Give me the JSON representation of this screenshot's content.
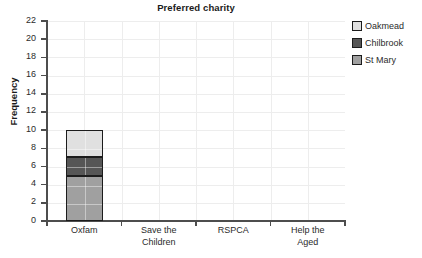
{
  "chart_data": {
    "type": "bar",
    "subtype": "stacked-vertical",
    "title": "Preferred charity",
    "xlabel": "",
    "ylabel": "Frequency",
    "ylim": [
      0,
      22
    ],
    "ytick_step": 2,
    "ytick_labels": [
      "0",
      "2",
      "4",
      "6",
      "8",
      "10",
      "12",
      "14",
      "16",
      "18",
      "20",
      "22"
    ],
    "grid": true,
    "legend_position": "right",
    "categories": [
      "Oxfam",
      "Save the Children",
      "RSPCA",
      "Help the Aged"
    ],
    "category_lines": [
      [
        "Oxfam"
      ],
      [
        "Save the",
        "Children"
      ],
      [
        "RSPCA"
      ],
      [
        "Help the",
        "Aged"
      ]
    ],
    "series": [
      {
        "name": "St Mary",
        "color": "#a0a0a0",
        "values": [
          5,
          0,
          0,
          0
        ]
      },
      {
        "name": "Chilbrook",
        "color": "#565656",
        "values": [
          2,
          0,
          0,
          0
        ]
      },
      {
        "name": "Oakmead",
        "color": "#e0e0e0",
        "values": [
          3,
          0,
          0,
          0
        ]
      }
    ],
    "stack_totals": [
      10,
      0,
      0,
      0
    ],
    "legend_entries": [
      {
        "label": "Oakmead",
        "color": "#e0e0e0"
      },
      {
        "label": "Chilbrook",
        "color": "#565656"
      },
      {
        "label": "St Mary",
        "color": "#a0a0a0"
      }
    ],
    "colors": {
      "oakmead": "#e0e0e0",
      "chilbrook": "#565656",
      "st_mary": "#a0a0a0",
      "axis": "#4d4d4d",
      "grid": "#ededed",
      "bar_outline": "#1c1c1c",
      "text": "#2b2b2b",
      "background": "#ffffff"
    }
  }
}
